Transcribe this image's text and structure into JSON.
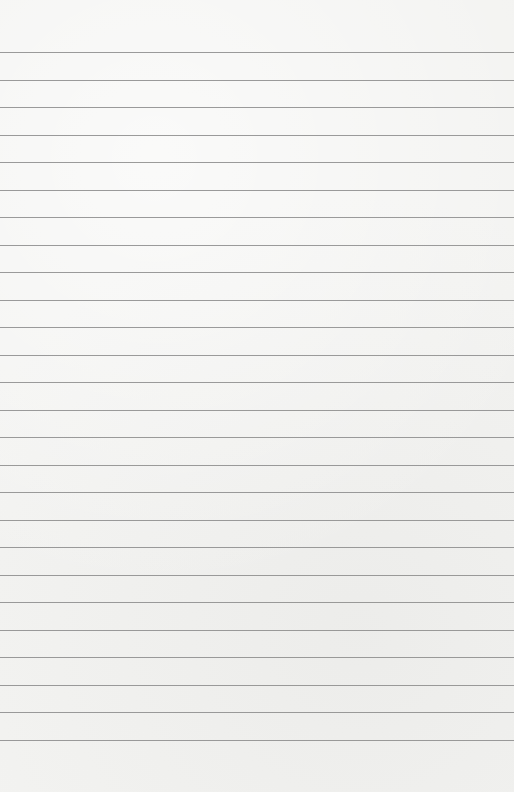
{
  "paper": {
    "type": "lined-paper",
    "background_color": "#f3f3f1",
    "line_color": "#8a8a8a",
    "first_line_y": 52,
    "line_spacing": 27.5,
    "line_count": 26
  }
}
